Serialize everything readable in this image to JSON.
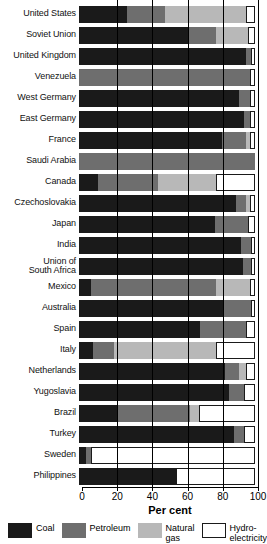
{
  "chart_data": {
    "type": "bar",
    "orientation": "horizontal",
    "stacked": true,
    "title": "",
    "xlabel": "Per cent",
    "ylabel": "",
    "xlim": [
      0,
      100
    ],
    "xticks": [
      0,
      20,
      40,
      60,
      80,
      100
    ],
    "xticklabels": [
      "0",
      "20",
      "40",
      "60",
      "80",
      "100"
    ],
    "grid": "vertical",
    "legend_position": "bottom",
    "legend": [
      {
        "name": "Coal",
        "color": "#1a1a1a"
      },
      {
        "name": "Petroleum",
        "color": "#6e6e6e"
      },
      {
        "name": "Natural\ngas",
        "color": "#b8b8b8"
      },
      {
        "name": "Hydro-\nelectricity",
        "color": "#ffffff"
      }
    ],
    "categories": [
      "United States",
      "Soviet Union",
      "United Kingdom",
      "Venezuela",
      "West Germany",
      "East Germany",
      "France",
      "Saudi Arabia",
      "Canada",
      "Czechoslovakia",
      "Japan",
      "India",
      "Union of\nSouth Africa",
      "Mexico",
      "Australia",
      "Spain",
      "Italy",
      "Netherlands",
      "Yugoslavia",
      "Brazil",
      "Turkey",
      "Sweden",
      "Philippines"
    ],
    "series": [
      {
        "name": "Coal",
        "values": [
          27,
          62,
          95,
          0,
          91,
          94,
          81,
          0,
          11,
          89,
          77,
          92,
          93,
          7,
          82,
          69,
          8,
          83,
          85,
          22,
          88,
          4,
          55
        ]
      },
      {
        "name": "Petroleum",
        "values": [
          22,
          16,
          3,
          97,
          6,
          3,
          14,
          100,
          34,
          6,
          19,
          6,
          5,
          71,
          16,
          26,
          12,
          8,
          9,
          41,
          6,
          3,
          0
        ]
      },
      {
        "name": "Natural gas",
        "values": [
          46,
          18,
          0,
          0,
          0,
          0,
          2,
          0,
          33,
          2,
          0,
          0,
          0,
          19,
          0,
          0,
          58,
          4,
          0,
          5,
          0,
          0,
          0
        ]
      },
      {
        "name": "Hydro-electricity",
        "values": [
          5,
          4,
          2,
          3,
          3,
          3,
          3,
          0,
          22,
          3,
          4,
          2,
          2,
          3,
          2,
          5,
          22,
          5,
          6,
          32,
          6,
          93,
          45
        ]
      }
    ],
    "rows": [
      {
        "label": "United States",
        "coal": 27,
        "petroleum": 22,
        "gas": 46,
        "hydro": 5
      },
      {
        "label": "Soviet Union",
        "coal": 62,
        "petroleum": 16,
        "gas": 18,
        "hydro": 4
      },
      {
        "label": "United Kingdom",
        "coal": 95,
        "petroleum": 3,
        "gas": 0,
        "hydro": 2
      },
      {
        "label": "Venezuela",
        "coal": 0,
        "petroleum": 97,
        "gas": 0,
        "hydro": 3
      },
      {
        "label": "West Germany",
        "coal": 91,
        "petroleum": 6,
        "gas": 0,
        "hydro": 3
      },
      {
        "label": "East Germany",
        "coal": 94,
        "petroleum": 3,
        "gas": 0,
        "hydro": 3
      },
      {
        "label": "France",
        "coal": 81,
        "petroleum": 14,
        "gas": 2,
        "hydro": 3
      },
      {
        "label": "Saudi Arabia",
        "coal": 0,
        "petroleum": 100,
        "gas": 0,
        "hydro": 0
      },
      {
        "label": "Canada",
        "coal": 11,
        "petroleum": 34,
        "gas": 33,
        "hydro": 22
      },
      {
        "label": "Czechoslovakia",
        "coal": 89,
        "petroleum": 6,
        "gas": 2,
        "hydro": 3
      },
      {
        "label": "Japan",
        "coal": 77,
        "petroleum": 19,
        "gas": 0,
        "hydro": 4
      },
      {
        "label": "India",
        "coal": 92,
        "petroleum": 6,
        "gas": 0,
        "hydro": 2
      },
      {
        "label": "Union of\nSouth Africa",
        "coal": 93,
        "petroleum": 5,
        "gas": 0,
        "hydro": 2
      },
      {
        "label": "Mexico",
        "coal": 7,
        "petroleum": 71,
        "gas": 19,
        "hydro": 3
      },
      {
        "label": "Australia",
        "coal": 82,
        "petroleum": 16,
        "gas": 0,
        "hydro": 2
      },
      {
        "label": "Spain",
        "coal": 69,
        "petroleum": 26,
        "gas": 0,
        "hydro": 5
      },
      {
        "label": "Italy",
        "coal": 8,
        "petroleum": 12,
        "gas": 58,
        "hydro": 22
      },
      {
        "label": "Netherlands",
        "coal": 83,
        "petroleum": 8,
        "gas": 4,
        "hydro": 5
      },
      {
        "label": "Yugoslavia",
        "coal": 85,
        "petroleum": 9,
        "gas": 0,
        "hydro": 6
      },
      {
        "label": "Brazil",
        "coal": 22,
        "petroleum": 41,
        "gas": 5,
        "hydro": 32
      },
      {
        "label": "Turkey",
        "coal": 88,
        "petroleum": 6,
        "gas": 0,
        "hydro": 6
      },
      {
        "label": "Sweden",
        "coal": 4,
        "petroleum": 3,
        "gas": 0,
        "hydro": 93
      },
      {
        "label": "Philippines",
        "coal": 55,
        "petroleum": 0,
        "gas": 0,
        "hydro": 45
      }
    ]
  }
}
